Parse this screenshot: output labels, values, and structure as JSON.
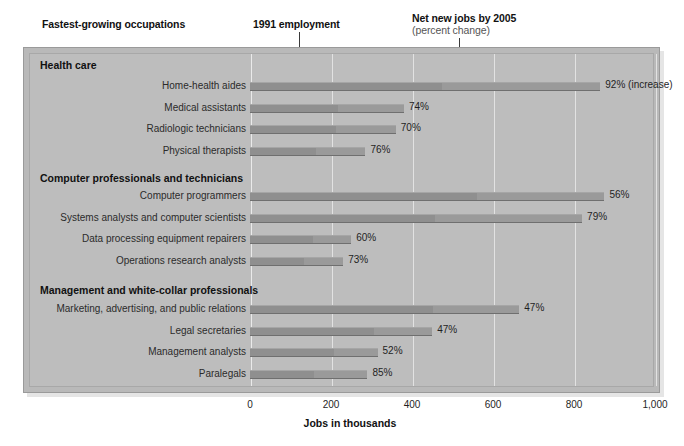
{
  "annotations": {
    "fastest_growing": "Fastest-growing occupations",
    "employment_1991": "1991 employment",
    "net_new_jobs": "Net new jobs by 2005",
    "net_new_jobs_sub": "(percent change)"
  },
  "chart_data": {
    "type": "bar",
    "title": "Fastest-growing occupations",
    "xlabel": "Jobs in thousands",
    "ylabel": "",
    "xlim": [
      0,
      1000
    ],
    "grid": true,
    "orientation": "horizontal",
    "legend": [
      "1991 employment",
      "Net new jobs by 2005"
    ],
    "tick_labels": [
      "0",
      "200",
      "400",
      "600",
      "800",
      "1,000"
    ],
    "ticks": [
      0,
      200,
      400,
      600,
      800,
      1000
    ],
    "groups": [
      {
        "name": "Health care",
        "rows": [
          {
            "label": "Home-health aides",
            "employment_1991": 475,
            "total": 865,
            "percent_label": "92% (increase)",
            "percent": 92
          },
          {
            "label": "Medical assistants",
            "employment_1991": 218,
            "total": 380,
            "percent_label": "74%",
            "percent": 74
          },
          {
            "label": "Radiologic technicians",
            "employment_1991": 212,
            "total": 360,
            "percent_label": "70%",
            "percent": 70
          },
          {
            "label": "Physical therapists",
            "employment_1991": 162,
            "total": 285,
            "percent_label": "76%",
            "percent": 76
          }
        ]
      },
      {
        "name": "Computer professionals and technicians",
        "rows": [
          {
            "label": "Computer programmers",
            "employment_1991": 560,
            "total": 875,
            "percent_label": "56%",
            "percent": 56
          },
          {
            "label": "Systems analysts and computer scientists",
            "employment_1991": 458,
            "total": 820,
            "percent_label": "79%",
            "percent": 79
          },
          {
            "label": "Data processing equipment repairers",
            "employment_1991": 156,
            "total": 250,
            "percent_label": "60%",
            "percent": 60
          },
          {
            "label": "Operations research analysts",
            "employment_1991": 133,
            "total": 230,
            "percent_label": "73%",
            "percent": 73
          }
        ]
      },
      {
        "name": "Management and white-collar professionals",
        "rows": [
          {
            "label": "Marketing, advertising, and public relations",
            "employment_1991": 452,
            "total": 665,
            "percent_label": "47%",
            "percent": 47
          },
          {
            "label": "Legal secretaries",
            "employment_1991": 306,
            "total": 450,
            "percent_label": "47%",
            "percent": 47
          },
          {
            "label": "Management analysts",
            "employment_1991": 207,
            "total": 315,
            "percent_label": "52%",
            "percent": 52
          },
          {
            "label": "Paralegals",
            "employment_1991": 157,
            "total": 290,
            "percent_label": "85%",
            "percent": 85
          }
        ]
      }
    ]
  },
  "colors": {
    "panel": "#bdbdbd",
    "panel_border": "#9a9a9a",
    "bar": "#8f8f8f",
    "bar_new_segment": "#9a9a9a",
    "gridline": "#e9e9e9",
    "text": "#1f1f1f"
  }
}
